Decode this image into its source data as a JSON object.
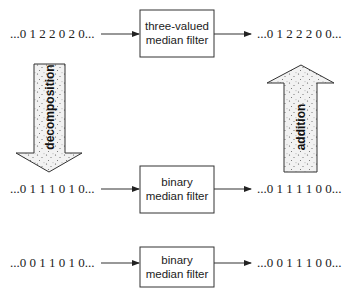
{
  "rows": [
    {
      "input": "...0 1 2 2 0 2 0...",
      "filter": [
        "three-valued",
        "median filter"
      ],
      "output": "...0 1 2 2 2 0 0..."
    },
    {
      "input": "...0 1 1 1 0 1 0...",
      "filter": [
        "binary",
        "median filter"
      ],
      "output": "...0 1 1 1 1 0 0..."
    },
    {
      "input": "...0 0 1 1 0 1 0...",
      "filter": [
        "binary",
        "median filter"
      ],
      "output": "...0 0 1 1 1 0 0..."
    }
  ],
  "arrows": {
    "left": {
      "label": "decomposition",
      "direction": "down"
    },
    "right": {
      "label": "addition",
      "direction": "up"
    }
  },
  "colors": {
    "stroke": "#333333",
    "box_fill": "#ffffff",
    "arrow_fill": "#eeeeee",
    "stipple": "#666666"
  }
}
